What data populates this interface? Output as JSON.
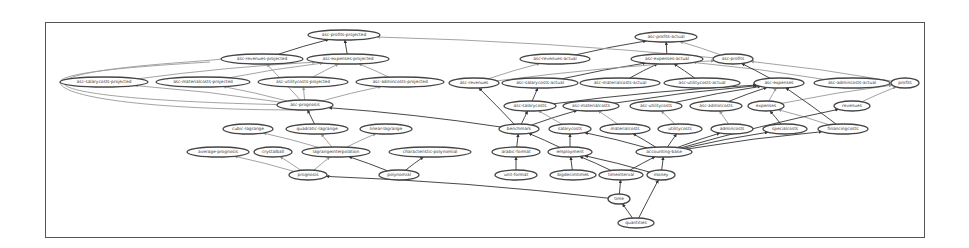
{
  "diagram": {
    "type": "directed-graph",
    "nodes": [
      {
        "id": "asc-profits-projected",
        "label": "asc-profits-projected",
        "x": 344,
        "y": 35,
        "w": 72
      },
      {
        "id": "asc-revenues-projected",
        "label": "asc-revenues-projected",
        "x": 262,
        "y": 59,
        "w": 82
      },
      {
        "id": "asc-expenses-projected",
        "label": "asc-expenses-projected",
        "x": 348,
        "y": 59,
        "w": 82
      },
      {
        "id": "asc-salarycosts-projected",
        "label": "asc-salarycosts-projected",
        "x": 104,
        "y": 82,
        "w": 88
      },
      {
        "id": "asc-materialcosts-projected",
        "label": "asc-materialcosts-projected",
        "x": 203,
        "y": 82,
        "w": 94
      },
      {
        "id": "asc-utilitycosts-projected",
        "label": "asc-utilitycosts-projected",
        "x": 303,
        "y": 82,
        "w": 90
      },
      {
        "id": "asc-admincosts-projected",
        "label": "asc-admincosts-projected",
        "x": 400,
        "y": 82,
        "w": 88
      },
      {
        "id": "asc-prognosis",
        "label": "asc-prognosis",
        "x": 305,
        "y": 105,
        "w": 56
      },
      {
        "id": "asc-profits-actual",
        "label": "asc-profits-actual",
        "x": 666,
        "y": 37,
        "w": 62
      },
      {
        "id": "asc-revenues-actual",
        "label": "asc-revenues-actual",
        "x": 555,
        "y": 59,
        "w": 70
      },
      {
        "id": "asc-expenses-actual",
        "label": "asc-expenses-actual",
        "x": 667,
        "y": 59,
        "w": 72
      },
      {
        "id": "asc-profits",
        "label": "asc-profits",
        "x": 733,
        "y": 59,
        "w": 40
      },
      {
        "id": "asc-revenues",
        "label": "asc-revenues",
        "x": 474,
        "y": 83,
        "w": 50
      },
      {
        "id": "asc-salarycosts-actual",
        "label": "asc-salarycosts-actual",
        "x": 540,
        "y": 83,
        "w": 76
      },
      {
        "id": "asc-materialcosts-actual",
        "label": "asc-materialcosts-actual",
        "x": 620,
        "y": 83,
        "w": 80
      },
      {
        "id": "asc-utilitycosts-actual",
        "label": "asc-utilitycosts-actual",
        "x": 702,
        "y": 83,
        "w": 76
      },
      {
        "id": "asc-expenses",
        "label": "asc-expenses",
        "x": 779,
        "y": 83,
        "w": 50
      },
      {
        "id": "asc-admincosts-actual",
        "label": "asc-admincosts-actual",
        "x": 852,
        "y": 83,
        "w": 76
      },
      {
        "id": "profits",
        "label": "profits",
        "x": 905,
        "y": 83,
        "w": 28
      },
      {
        "id": "asc-salarycosts",
        "label": "asc-salarycosts",
        "x": 530,
        "y": 106,
        "w": 52
      },
      {
        "id": "asc-materialcosts",
        "label": "asc-materialcosts",
        "x": 591,
        "y": 106,
        "w": 56
      },
      {
        "id": "asc-utilitycosts",
        "label": "asc-utilitycosts",
        "x": 656,
        "y": 106,
        "w": 52
      },
      {
        "id": "asc-admincosts",
        "label": "asc-admincosts",
        "x": 716,
        "y": 106,
        "w": 52
      },
      {
        "id": "expenses",
        "label": "expenses",
        "x": 766,
        "y": 106,
        "w": 36
      },
      {
        "id": "revenues",
        "label": "revenues",
        "x": 852,
        "y": 106,
        "w": 36
      },
      {
        "id": "quadratic-lagrange",
        "label": "quadratic-lagrange",
        "x": 317,
        "y": 129,
        "w": 62
      },
      {
        "id": "cubic-lagrange",
        "label": "cubic-lagrange",
        "x": 248,
        "y": 129,
        "w": 50
      },
      {
        "id": "linear-lagrange",
        "label": "linear-lagrange",
        "x": 386,
        "y": 129,
        "w": 52
      },
      {
        "id": "benchmark",
        "label": "benchmark",
        "x": 519,
        "y": 129,
        "w": 40
      },
      {
        "id": "salarycosts",
        "label": "salarycosts",
        "x": 570,
        "y": 129,
        "w": 42
      },
      {
        "id": "materialcosts",
        "label": "materialcosts",
        "x": 625,
        "y": 129,
        "w": 50
      },
      {
        "id": "utilitycosts",
        "label": "utilitycosts",
        "x": 680,
        "y": 129,
        "w": 44
      },
      {
        "id": "admincosts",
        "label": "admincosts",
        "x": 732,
        "y": 129,
        "w": 42
      },
      {
        "id": "specialcosts",
        "label": "specialcosts",
        "x": 785,
        "y": 129,
        "w": 44
      },
      {
        "id": "financingcosts",
        "label": "financingcosts",
        "x": 843,
        "y": 129,
        "w": 50
      },
      {
        "id": "average-prognosis",
        "label": "average-prognosis",
        "x": 218,
        "y": 152,
        "w": 62
      },
      {
        "id": "crystalball",
        "label": "crystalball",
        "x": 273,
        "y": 152,
        "w": 38
      },
      {
        "id": "lagrangeinterpolation",
        "label": "lagrangeinterpolation",
        "x": 336,
        "y": 152,
        "w": 68
      },
      {
        "id": "characteristic-polynomial",
        "label": "characteristic-polynomial",
        "x": 430,
        "y": 152,
        "w": 82
      },
      {
        "id": "arabic-format",
        "label": "arabic-format",
        "x": 516,
        "y": 152,
        "w": 48
      },
      {
        "id": "employment",
        "label": "employment",
        "x": 570,
        "y": 152,
        "w": 44
      },
      {
        "id": "accounting-base",
        "label": "accounting-base",
        "x": 664,
        "y": 152,
        "w": 56
      },
      {
        "id": "prognosis",
        "label": "prognosis",
        "x": 308,
        "y": 175,
        "w": 38
      },
      {
        "id": "polynomial",
        "label": "polynomial",
        "x": 399,
        "y": 175,
        "w": 40
      },
      {
        "id": "unit-format",
        "label": "unit-format",
        "x": 516,
        "y": 175,
        "w": 42
      },
      {
        "id": "bigdecimtimes",
        "label": "bigdecimtimes",
        "x": 573,
        "y": 175,
        "w": 46
      },
      {
        "id": "timeinterval",
        "label": "timeinterval",
        "x": 621,
        "y": 175,
        "w": 44
      },
      {
        "id": "money",
        "label": "money",
        "x": 661,
        "y": 175,
        "w": 28
      },
      {
        "id": "time",
        "label": "time",
        "x": 619,
        "y": 199,
        "w": 22
      },
      {
        "id": "quantities",
        "label": "quantities",
        "x": 636,
        "y": 223,
        "w": 36
      }
    ],
    "edges": [
      [
        "asc-revenues-projected",
        "asc-profits-projected",
        "dark"
      ],
      [
        "asc-expenses-projected",
        "asc-profits-projected",
        "dark"
      ],
      [
        "asc-salarycosts-projected",
        "asc-expenses-projected",
        "light"
      ],
      [
        "asc-materialcosts-projected",
        "asc-expenses-projected",
        "light"
      ],
      [
        "asc-utilitycosts-projected",
        "asc-expenses-projected",
        "light"
      ],
      [
        "asc-admincosts-projected",
        "asc-expenses-projected",
        "light"
      ],
      [
        "asc-prognosis",
        "asc-salarycosts-projected",
        "light"
      ],
      [
        "asc-prognosis",
        "asc-materialcosts-projected",
        "light"
      ],
      [
        "asc-prognosis",
        "asc-utilitycosts-projected",
        "light"
      ],
      [
        "asc-prognosis",
        "asc-admincosts-projected",
        "light"
      ],
      [
        "asc-prognosis",
        "asc-revenues-projected",
        "light"
      ],
      [
        "quadratic-lagrange",
        "asc-prognosis",
        "dark"
      ],
      [
        "lagrangeinterpolation",
        "quadratic-lagrange",
        "light"
      ],
      [
        "lagrangeinterpolation",
        "cubic-lagrange",
        "light"
      ],
      [
        "lagrangeinterpolation",
        "linear-lagrange",
        "light"
      ],
      [
        "prognosis",
        "average-prognosis",
        "light"
      ],
      [
        "prognosis",
        "crystalball",
        "light"
      ],
      [
        "prognosis",
        "lagrangeinterpolation",
        "light"
      ],
      [
        "polynomial",
        "lagrangeinterpolation",
        "dark"
      ],
      [
        "polynomial",
        "characteristic-polynomial",
        "dark"
      ],
      [
        "time",
        "prognosis",
        "dark"
      ],
      [
        "benchmark",
        "asc-prognosis",
        "dark"
      ],
      [
        "asc-revenues-actual",
        "asc-profits-actual",
        "dark"
      ],
      [
        "asc-expenses-actual",
        "asc-profits-actual",
        "dark"
      ],
      [
        "asc-profits",
        "asc-profits-actual",
        "light"
      ],
      [
        "asc-profits",
        "asc-profits-projected",
        "light"
      ],
      [
        "asc-revenues",
        "asc-revenues-actual",
        "light"
      ],
      [
        "asc-salarycosts-actual",
        "asc-expenses-actual",
        "dark"
      ],
      [
        "asc-materialcosts-actual",
        "asc-expenses-actual",
        "dark"
      ],
      [
        "asc-utilitycosts-actual",
        "asc-expenses-actual",
        "dark"
      ],
      [
        "asc-admincosts-actual",
        "asc-expenses-actual",
        "light"
      ],
      [
        "asc-expenses",
        "asc-profits",
        "dark"
      ],
      [
        "asc-revenues",
        "asc-profits",
        "light"
      ],
      [
        "profits",
        "asc-profits",
        "light"
      ],
      [
        "asc-salarycosts",
        "asc-salarycosts-actual",
        "dark"
      ],
      [
        "asc-salarycosts",
        "asc-expenses",
        "dark"
      ],
      [
        "asc-materialcosts",
        "asc-expenses",
        "dark"
      ],
      [
        "asc-utilitycosts",
        "asc-expenses",
        "dark"
      ],
      [
        "asc-admincosts",
        "asc-expenses",
        "dark"
      ],
      [
        "expenses",
        "asc-expenses",
        "light"
      ],
      [
        "expenses",
        "profits",
        "light"
      ],
      [
        "revenues",
        "profits",
        "light"
      ],
      [
        "benchmark",
        "asc-salarycosts",
        "dark"
      ],
      [
        "benchmark",
        "asc-materialcosts",
        "dark"
      ],
      [
        "benchmark",
        "asc-revenues",
        "dark"
      ],
      [
        "salarycosts",
        "asc-salarycosts",
        "light"
      ],
      [
        "materialcosts",
        "asc-materialcosts",
        "light"
      ],
      [
        "utilitycosts",
        "asc-utilitycosts",
        "light"
      ],
      [
        "admincosts",
        "asc-admincosts",
        "light"
      ],
      [
        "specialcosts",
        "expenses",
        "dark"
      ],
      [
        "financingcosts",
        "expenses",
        "light"
      ],
      [
        "financingcosts",
        "asc-expenses",
        "dark"
      ],
      [
        "arabic-format",
        "benchmark",
        "dark"
      ],
      [
        "employment",
        "benchmark",
        "dark"
      ],
      [
        "employment",
        "salarycosts",
        "dark"
      ],
      [
        "accounting-base",
        "materialcosts",
        "dark"
      ],
      [
        "accounting-base",
        "utilitycosts",
        "dark"
      ],
      [
        "accounting-base",
        "admincosts",
        "dark"
      ],
      [
        "accounting-base",
        "specialcosts",
        "dark"
      ],
      [
        "accounting-base",
        "financingcosts",
        "dark"
      ],
      [
        "accounting-base",
        "revenues",
        "dark"
      ],
      [
        "accounting-base",
        "salarycosts",
        "dark"
      ],
      [
        "unit-format",
        "arabic-format",
        "dark"
      ],
      [
        "bigdecimtimes",
        "employment",
        "dark"
      ],
      [
        "timeinterval",
        "employment",
        "dark"
      ],
      [
        "timeinterval",
        "accounting-base",
        "dark"
      ],
      [
        "money",
        "employment",
        "dark"
      ],
      [
        "money",
        "accounting-base",
        "dark"
      ],
      [
        "time",
        "timeinterval",
        "dark"
      ],
      [
        "quantities",
        "time",
        "dark"
      ],
      [
        "quantities",
        "money",
        "dark"
      ]
    ]
  }
}
